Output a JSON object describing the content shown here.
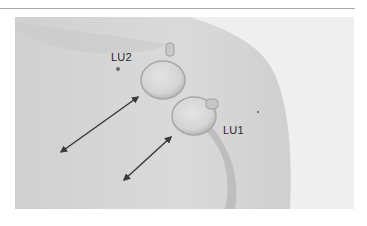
{
  "figure": {
    "labels": [
      {
        "id": "lu2",
        "text": "LU2"
      },
      {
        "id": "lu1",
        "text": "LU1"
      }
    ],
    "arrows": [
      {
        "from": [
          61,
          152
        ],
        "to": [
          138,
          97
        ]
      },
      {
        "from": [
          124,
          180
        ],
        "to": [
          171,
          137
        ]
      }
    ],
    "cups": 2,
    "colors": {
      "rule": "#a9a9a9",
      "skin_light": "#e6e6e6",
      "skin_mid": "#d2d2d2",
      "background": "#f2f2f2",
      "arrow": "#3a3a3a"
    }
  }
}
